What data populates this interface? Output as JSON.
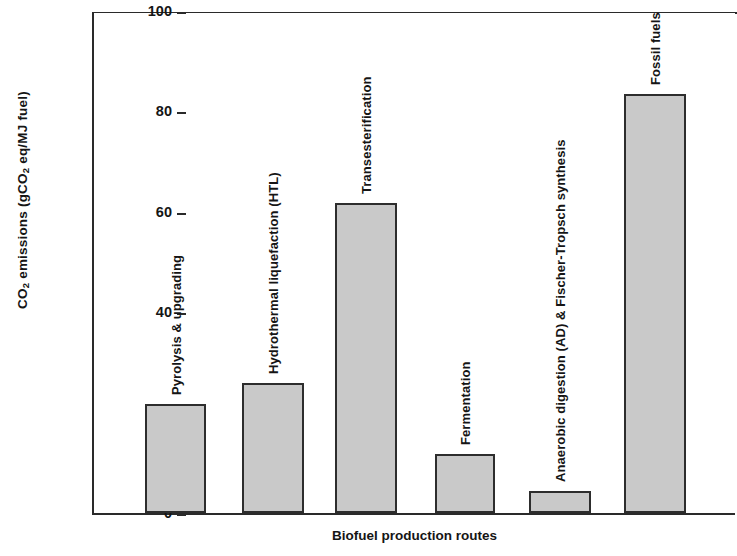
{
  "chart_data": {
    "type": "bar",
    "title": "",
    "xlabel": "Biofuel production routes",
    "ylabel_plain": "CO2 emissions (gCO2 eq/MJ fuel)",
    "ylabel_prefix": "CO",
    "ylabel_sub1": "2",
    "ylabel_mid": " emissions (gCO",
    "ylabel_sub2": "2",
    "ylabel_suffix": " eq/MJ fuel)",
    "categories": [
      "Pyrolysis & upgrading",
      "Hydrothermal liquefaction (HTL)",
      "Transesterification",
      "Fermentation",
      "Anaerobic digestion (AD) & Fischer-Tropsch synthesis",
      "Fossil fuels"
    ],
    "values": [
      21.7,
      25.8,
      61.8,
      11.8,
      4.4,
      83.5
    ],
    "ylim": [
      0,
      100
    ],
    "yticks": [
      0,
      20,
      40,
      60,
      80,
      100
    ],
    "ytick_labels": [
      "0",
      "20",
      "40",
      "60",
      "80",
      "100"
    ],
    "grid": false,
    "legend": "none",
    "bar_fill_color": "#c9c9c9",
    "bar_edge_color": "#2d2d2d",
    "axis_color": "#2a2a2a"
  }
}
